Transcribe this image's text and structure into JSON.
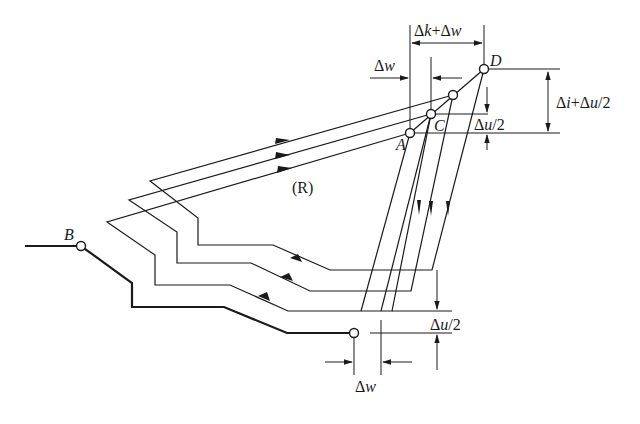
{
  "diagram": {
    "region_label": "(R)",
    "points": {
      "A": {
        "label": "A",
        "x": 410,
        "y": 133
      },
      "B": {
        "label": "B",
        "x": 81,
        "y": 246
      },
      "C": {
        "label": "C",
        "x": 431,
        "y": 114
      },
      "D": {
        "label": "D",
        "x": 484,
        "y": 69
      },
      "mid": {
        "x": 453,
        "y": 95
      },
      "end": {
        "x": 354,
        "y": 333
      }
    },
    "dimensions": {
      "top_width": {
        "delta1": "k",
        "delta2": "w",
        "text_prefix": "Δ",
        "plus": "+"
      },
      "left_top": {
        "text": "Δ",
        "var": "w"
      },
      "right_height": {
        "d1": "i",
        "d2": "u",
        "suffix": "/2"
      },
      "right_small": {
        "var": "u",
        "suffix": "/2"
      },
      "bottom_small": {
        "var": "u",
        "suffix": "/2"
      },
      "bottom_width": {
        "var": "w"
      }
    },
    "colors": {
      "stroke": "#1a1a1a",
      "background": "#ffffff"
    }
  }
}
